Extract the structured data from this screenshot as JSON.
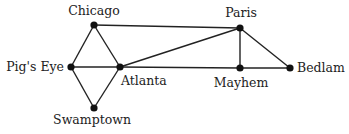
{
  "graph": {
    "nodes": [
      {
        "id": "chicago",
        "label": "Chicago",
        "x": 94,
        "y": 25,
        "lx": 94,
        "ly": 15,
        "anchor": "middle"
      },
      {
        "id": "pigs_eye",
        "label": "Pig's Eye",
        "x": 71,
        "y": 67,
        "lx": 64,
        "ly": 71,
        "anchor": "end"
      },
      {
        "id": "atlanta",
        "label": "Atlanta",
        "x": 120,
        "y": 67,
        "lx": 121,
        "ly": 85,
        "anchor": "start"
      },
      {
        "id": "swamptown",
        "label": "Swamptown",
        "x": 94,
        "y": 108,
        "lx": 92,
        "ly": 124,
        "anchor": "middle"
      },
      {
        "id": "paris",
        "label": "Paris",
        "x": 240,
        "y": 28,
        "lx": 241,
        "ly": 17,
        "anchor": "middle"
      },
      {
        "id": "mayhem",
        "label": "Mayhem",
        "x": 240,
        "y": 68,
        "lx": 241,
        "ly": 87,
        "anchor": "middle"
      },
      {
        "id": "bedlam",
        "label": "Bedlam",
        "x": 290,
        "y": 68,
        "lx": 297,
        "ly": 72,
        "anchor": "start"
      }
    ],
    "edges": [
      [
        "chicago",
        "paris"
      ],
      [
        "chicago",
        "pigs_eye"
      ],
      [
        "chicago",
        "atlanta"
      ],
      [
        "pigs_eye",
        "atlanta"
      ],
      [
        "pigs_eye",
        "swamptown"
      ],
      [
        "atlanta",
        "swamptown"
      ],
      [
        "atlanta",
        "paris"
      ],
      [
        "atlanta",
        "mayhem"
      ],
      [
        "mayhem",
        "bedlam"
      ],
      [
        "paris",
        "mayhem"
      ],
      [
        "paris",
        "bedlam"
      ]
    ],
    "colors": {
      "edge": "#222222",
      "node": "#111111",
      "label": "#222222"
    }
  }
}
